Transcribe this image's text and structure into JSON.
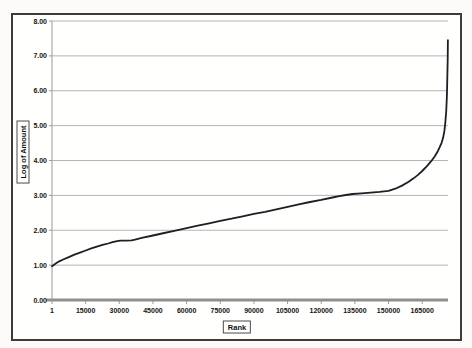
{
  "chart_data": {
    "type": "line",
    "title": "",
    "xlabel": "Rank",
    "ylabel": "Log of Amount",
    "xlim": [
      0,
      176500
    ],
    "ylim": [
      0,
      8
    ],
    "grid": "horizontal-only",
    "legend": "none",
    "y_ticks": [
      {
        "value": 0,
        "label": "0.00"
      },
      {
        "value": 1,
        "label": "1.00"
      },
      {
        "value": 2,
        "label": "2.00"
      },
      {
        "value": 3,
        "label": "3.00"
      },
      {
        "value": 4,
        "label": "4.00"
      },
      {
        "value": 5,
        "label": "5.00"
      },
      {
        "value": 6,
        "label": "6.00"
      },
      {
        "value": 7,
        "label": "7.00"
      },
      {
        "value": 8,
        "label": "8.00"
      }
    ],
    "x_ticks": [
      {
        "value": 1,
        "label": "1"
      },
      {
        "value": 15000,
        "label": "15000"
      },
      {
        "value": 30000,
        "label": "30000"
      },
      {
        "value": 45000,
        "label": "45000"
      },
      {
        "value": 60000,
        "label": "60000"
      },
      {
        "value": 75000,
        "label": "75000"
      },
      {
        "value": 90000,
        "label": "90000"
      },
      {
        "value": 105000,
        "label": "105000"
      },
      {
        "value": 120000,
        "label": "120000"
      },
      {
        "value": 135000,
        "label": "135000"
      },
      {
        "value": 150000,
        "label": "150000"
      },
      {
        "value": 165000,
        "label": "165000"
      }
    ],
    "series": [
      {
        "name": "log-of-amount-by-rank",
        "color": "#1e1e24",
        "points": [
          [
            1,
            0.97
          ],
          [
            1500,
            1.04
          ],
          [
            3000,
            1.1
          ],
          [
            5000,
            1.16
          ],
          [
            7500,
            1.23
          ],
          [
            10000,
            1.3
          ],
          [
            12500,
            1.36
          ],
          [
            15000,
            1.42
          ],
          [
            17500,
            1.48
          ],
          [
            20000,
            1.53
          ],
          [
            22500,
            1.58
          ],
          [
            25000,
            1.62
          ],
          [
            27000,
            1.66
          ],
          [
            29000,
            1.69
          ],
          [
            30500,
            1.7
          ],
          [
            33000,
            1.7
          ],
          [
            35500,
            1.71
          ],
          [
            37000,
            1.73
          ],
          [
            40000,
            1.78
          ],
          [
            45000,
            1.85
          ],
          [
            50000,
            1.92
          ],
          [
            55000,
            1.99
          ],
          [
            60000,
            2.06
          ],
          [
            65000,
            2.13
          ],
          [
            70000,
            2.2
          ],
          [
            75000,
            2.27
          ],
          [
            80000,
            2.33
          ],
          [
            85000,
            2.4
          ],
          [
            90000,
            2.47
          ],
          [
            95000,
            2.53
          ],
          [
            100000,
            2.6
          ],
          [
            105000,
            2.67
          ],
          [
            110000,
            2.74
          ],
          [
            115000,
            2.81
          ],
          [
            120000,
            2.87
          ],
          [
            125000,
            2.94
          ],
          [
            128000,
            2.98
          ],
          [
            131000,
            3.01
          ],
          [
            134000,
            3.04
          ],
          [
            138000,
            3.06
          ],
          [
            142000,
            3.08
          ],
          [
            146000,
            3.1
          ],
          [
            150000,
            3.13
          ],
          [
            153000,
            3.19
          ],
          [
            156000,
            3.28
          ],
          [
            159000,
            3.39
          ],
          [
            161000,
            3.48
          ],
          [
            163000,
            3.58
          ],
          [
            165000,
            3.7
          ],
          [
            167000,
            3.83
          ],
          [
            169000,
            3.98
          ],
          [
            170500,
            4.11
          ],
          [
            171800,
            4.25
          ],
          [
            172800,
            4.38
          ],
          [
            173600,
            4.5
          ],
          [
            174300,
            4.65
          ],
          [
            174900,
            4.85
          ],
          [
            175300,
            5.08
          ],
          [
            175700,
            5.4
          ],
          [
            176000,
            5.85
          ],
          [
            176200,
            6.35
          ],
          [
            176350,
            6.9
          ],
          [
            176450,
            7.45
          ]
        ]
      }
    ]
  },
  "colors": {
    "gridline": "#b5b5b5",
    "axis_line": "#9a9a9a",
    "zero_axis": "#8f8f8f",
    "tick_text": "#141414",
    "frame_border": "#3c3c3c",
    "plot_background": "#fffffe",
    "page_background": "#fcfbf9"
  }
}
